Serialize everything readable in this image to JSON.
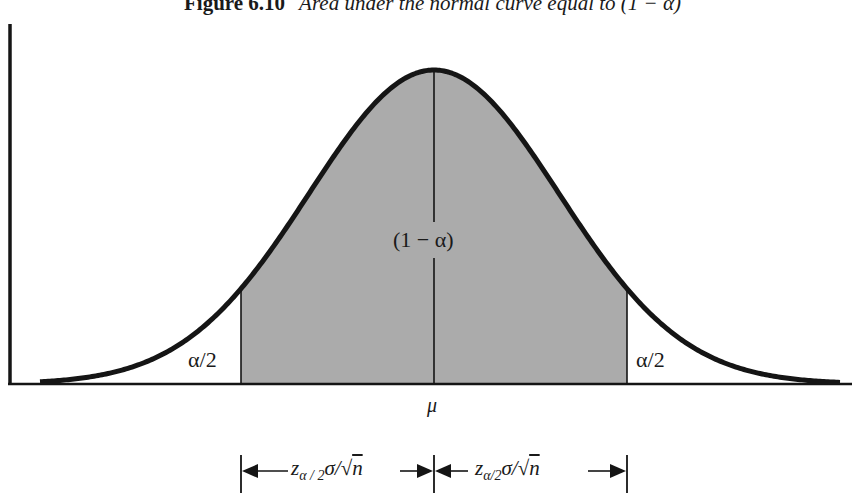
{
  "figure": {
    "number": "Figure 6.10",
    "caption": "Area under the normal curve equal to (1 − α)"
  },
  "labels": {
    "center_area": "(1 − α)",
    "left_tail": "α/2",
    "right_tail": "α/2",
    "mean": "μ",
    "left_interval": {
      "z": "z",
      "sub": "α / 2",
      "rest": "σ/√",
      "n": "n"
    },
    "right_interval": {
      "z": "z",
      "sub": "α/2",
      "rest": "σ/√",
      "n": "n"
    }
  },
  "colors": {
    "shaded_area": "#ababab",
    "curve": "#151515",
    "background": "#ffffff"
  },
  "chart_data": {
    "type": "area",
    "distribution": "normal",
    "mean_label": "μ",
    "shaded_region": {
      "from": "μ − z_{α/2}σ/√n",
      "to": "μ + z_{α/2}σ/√n",
      "area": "1 − α"
    },
    "tail_regions": [
      {
        "side": "left",
        "area": "α/2"
      },
      {
        "side": "right",
        "area": "α/2"
      }
    ],
    "intervals": [
      {
        "from": "left cutoff",
        "to": "μ",
        "label": "z_{α/2}σ/√n"
      },
      {
        "from": "μ",
        "to": "right cutoff",
        "label": "z_{α/2}σ/√n"
      }
    ],
    "xlabel": "",
    "ylabel": "",
    "grid": false
  }
}
